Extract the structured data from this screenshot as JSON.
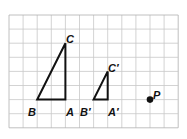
{
  "diagram": {
    "grid": {
      "origin_x": 9,
      "origin_y": 15,
      "cell": 14.1,
      "cols": 12,
      "rows": 8,
      "line_color": "#c8c8c8",
      "border_color": "#b0b0b0"
    },
    "stroke_color": "#111111",
    "triangles": [
      {
        "name": "ABC",
        "vertices": {
          "A": [
            4,
            6
          ],
          "B": [
            2,
            6
          ],
          "C": [
            4,
            2
          ]
        }
      },
      {
        "name": "A'B'C'",
        "vertices": {
          "A'": [
            7,
            6
          ],
          "B'": [
            6,
            6
          ],
          "C'": [
            7,
            4
          ]
        }
      }
    ],
    "point": {
      "name": "P",
      "pos": [
        10,
        6
      ]
    },
    "labels": {
      "A": "A",
      "B": "B",
      "C": "C",
      "A_prime": "A′",
      "B_prime": "B′",
      "C_prime": "C′",
      "P": "P"
    }
  }
}
